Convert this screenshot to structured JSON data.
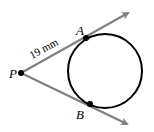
{
  "diagram": {
    "type": "tangent-lines-to-circle",
    "points": {
      "P": {
        "label": "P",
        "x": 21,
        "y": 73
      },
      "A": {
        "label": "A",
        "x": 86,
        "y": 38
      },
      "B": {
        "label": "B",
        "x": 90,
        "y": 104
      }
    },
    "circle": {
      "cx": 105,
      "cy": 71,
      "r": 37
    },
    "measurement": {
      "label": "19 mm",
      "segment": "PA"
    },
    "colors": {
      "ray": "#808080",
      "circle": "#000000",
      "point": "#000000"
    }
  }
}
